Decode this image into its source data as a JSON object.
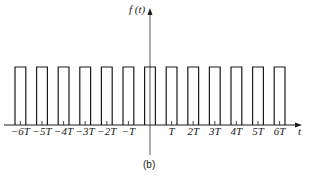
{
  "figure": {
    "caption": "(b)",
    "y_axis_label": "f (t)",
    "x_axis_label": "t"
  },
  "pulse_train": {
    "period_label": "T",
    "pulse_centers": [
      -6,
      -5,
      -4,
      -3,
      -2,
      -1,
      0,
      1,
      2,
      3,
      4,
      5,
      6
    ],
    "tick_labels": [
      "−6T",
      "−5T",
      "−4T",
      "−3T",
      "−2T",
      "−T",
      "",
      "T",
      "2T",
      "3T",
      "4T",
      "5T",
      "6T"
    ],
    "pulse_count": 13,
    "pulse_height_relative": 1.0,
    "duty_width_fraction": 0.5
  },
  "colors": {
    "line": "#1a1a1a",
    "background": "#ffffff"
  }
}
